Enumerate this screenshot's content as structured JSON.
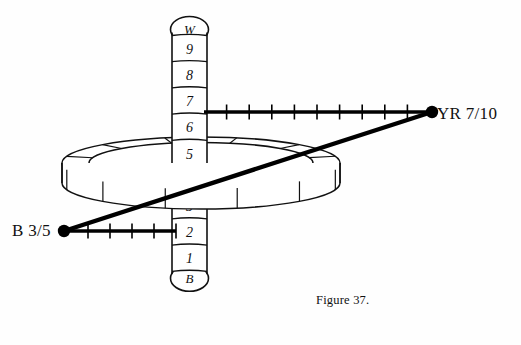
{
  "figure": {
    "caption": "Figure 37."
  },
  "value_column": {
    "top_cap_label": "W",
    "bottom_cap_label": "B",
    "steps": [
      "9",
      "8",
      "7",
      "6",
      "5",
      "4",
      "3",
      "2",
      "1"
    ],
    "center_x": 189.5,
    "cell_width": 35,
    "cell_height": 26.2,
    "top_y": 35.5
  },
  "hue_circle": {
    "name": "hue-ring",
    "center_x": 201,
    "center_y": 163,
    "outer_rx": 139,
    "outer_ry": 26,
    "inner_rx": 112,
    "inner_ry": 20.5,
    "band_depth": 20,
    "segments": 12
  },
  "chroma_axes": [
    {
      "name": "upper-chroma-axis",
      "label": "YR 7/10",
      "value_level": "7",
      "chroma": 10,
      "y": 112,
      "x_start": 204,
      "x_end": 430,
      "ticks": 10,
      "endpoint_dot": {
        "x": 432,
        "y": 112,
        "r": 6.2
      }
    },
    {
      "name": "lower-chroma-axis",
      "label": "B 3/5",
      "value_level": "3",
      "chroma": 5,
      "y": 231,
      "x_start": 66,
      "x_end": 176,
      "ticks": 5,
      "endpoint_dot": {
        "x": 64,
        "y": 231,
        "r": 6.2
      }
    }
  ],
  "connector": {
    "name": "chroma-connector-line",
    "from_label": "B 3/5",
    "to_label": "YR 7/10",
    "x1": 64,
    "y1": 231,
    "x2": 432,
    "y2": 112
  },
  "colors": {
    "ink": "#111111",
    "line": "#000000",
    "background": "#ffffff"
  }
}
